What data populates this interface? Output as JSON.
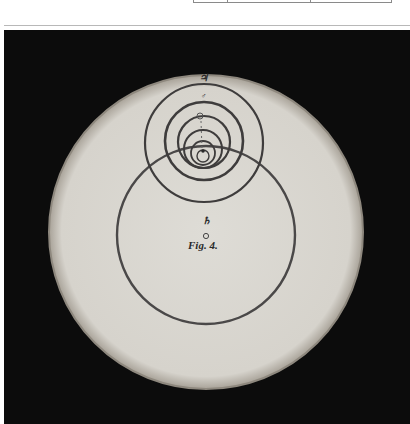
{
  "table_fragment": {
    "column_dividers_x": [
      193,
      227,
      310,
      392
    ]
  },
  "figure": {
    "caption": "Fig. 4.",
    "center_symbol": "♄",
    "top_symbol": "♃",
    "mars_symbol": "♂",
    "colors": {
      "background": "#0c0c0c",
      "disc": "#dcdad4",
      "disc_edge": "#9a948a",
      "ink": "#3a3a3a"
    },
    "disc": {
      "cx": 206,
      "cy": 232,
      "r": 157
    },
    "large_circle": {
      "cx": 206,
      "cy": 235,
      "r": 89
    },
    "nested_circles": [
      {
        "cx": 204,
        "cy": 143,
        "r": 59,
        "w": 2.2
      },
      {
        "cx": 204,
        "cy": 141,
        "r": 39,
        "w": 2.6
      },
      {
        "cx": 204,
        "cy": 142,
        "r": 26,
        "w": 2.2
      },
      {
        "cx": 203,
        "cy": 149,
        "r": 19,
        "w": 2.0
      },
      {
        "cx": 203,
        "cy": 153,
        "r": 12,
        "w": 1.8
      },
      {
        "cx": 203,
        "cy": 156,
        "r": 6,
        "w": 1.4
      }
    ]
  }
}
